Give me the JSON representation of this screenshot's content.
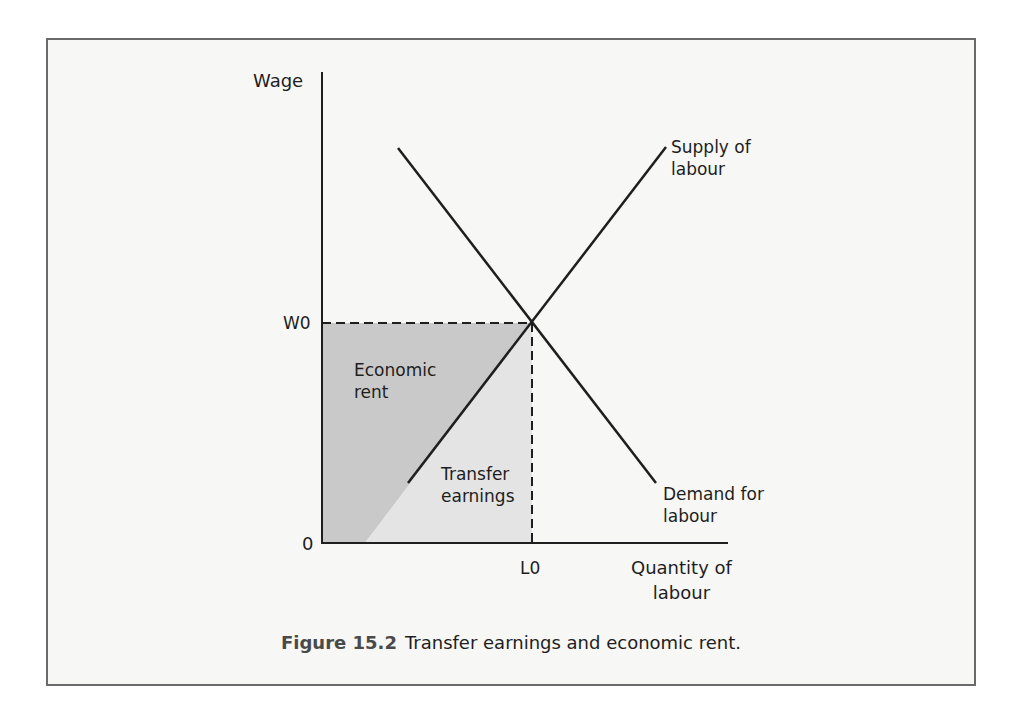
{
  "figure": {
    "number_label": "Figure 15.2",
    "caption_text": "Transfer earnings and economic rent."
  },
  "axes": {
    "y_label": "Wage",
    "x_label_line1": "Quantity of",
    "x_label_line2": "labour",
    "origin_label": "0",
    "w0_label": "W0",
    "l0_label": "L0"
  },
  "curves": {
    "supply_line1": "Supply of",
    "supply_line2": "labour",
    "demand_line1": "Demand for",
    "demand_line2": "labour"
  },
  "regions": {
    "economic_rent_line1": "Economic",
    "economic_rent_line2": "rent",
    "transfer_line1": "Transfer",
    "transfer_line2": "earnings"
  },
  "colors": {
    "economic_rent_fill": "#c9c9c9",
    "transfer_earnings_fill": "#e4e4e4",
    "line": "#1e1e1e",
    "frame_bg": "#f7f7f5"
  }
}
